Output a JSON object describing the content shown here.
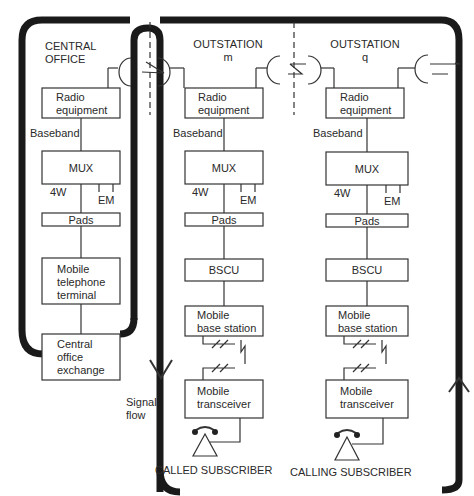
{
  "sections": {
    "central_office": {
      "title_line1": "CENTRAL",
      "title_line2": "OFFICE"
    },
    "outstation_m": {
      "title_line1": "OUTSTATION",
      "title_line2": "m"
    },
    "outstation_q": {
      "title_line1": "OUTSTATION",
      "title_line2": "q"
    }
  },
  "blocks": {
    "radio_line1": "Radio",
    "radio_line2": "equipment",
    "baseband": "Baseband",
    "mux": "MUX",
    "four_wire": "4W",
    "em": "EM",
    "pads": "Pads",
    "bscu": "BSCU",
    "mtt_line1": "Mobile",
    "mtt_line2": "telephone",
    "mtt_line3": "terminal",
    "coe_line1": "Central",
    "coe_line2": "office",
    "coe_line3": "exchange",
    "mbs_line1": "Mobile",
    "mbs_line2": "base station",
    "mt_line1": "Mobile",
    "mt_line2": "transceiver"
  },
  "signal_flow": {
    "line1": "Signal",
    "line2": "flow"
  },
  "subscribers": {
    "called": "CALLED SUBSCRIBER",
    "calling": "CALLING SUBSCRIBER"
  }
}
